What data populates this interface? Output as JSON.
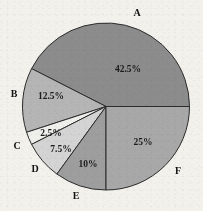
{
  "chart_data": {
    "type": "pie",
    "title": "",
    "subtitle": "",
    "xlabel": "",
    "ylabel": "",
    "legend_position": "none",
    "grid": false,
    "start_angle_deg": 0,
    "direction": "counterclockwise",
    "categories": [
      "A",
      "B",
      "C",
      "D",
      "E",
      "F"
    ],
    "values": [
      42.5,
      12.5,
      2.5,
      7.5,
      10,
      25
    ],
    "value_labels": [
      "42.5%",
      "12.5%",
      "2.5%",
      "7.5%",
      "10%",
      "25%"
    ],
    "colors": [
      "#8c8c8c",
      "#b5b5b5",
      "#efefec",
      "#d4d4d4",
      "#9e9e9e",
      "#a8a8a8"
    ],
    "slices": [
      {
        "name": "A",
        "value": 42.5,
        "value_label": "42.5%",
        "color": "#8c8c8c",
        "start_deg": 0,
        "end_deg": 153,
        "label_x": 128,
        "label_y": 70,
        "cat_x": 137,
        "cat_y": 14
      },
      {
        "name": "B",
        "value": 12.5,
        "value_label": "12.5%",
        "color": "#b5b5b5",
        "start_deg": 153,
        "end_deg": 198,
        "label_x": 51,
        "label_y": 97,
        "cat_x": 14,
        "cat_y": 95
      },
      {
        "name": "C",
        "value": 2.5,
        "value_label": "2.5%",
        "color": "#efefec",
        "start_deg": 198,
        "end_deg": 207,
        "label_x": 51,
        "label_y": 134,
        "cat_x": 17,
        "cat_y": 147
      },
      {
        "name": "D",
        "value": 7.5,
        "value_label": "7.5%",
        "color": "#d4d4d4",
        "start_deg": 207,
        "end_deg": 234,
        "label_x": 61,
        "label_y": 150,
        "cat_x": 35,
        "cat_y": 170
      },
      {
        "name": "E",
        "value": 10,
        "value_label": "10%",
        "color": "#9e9e9e",
        "start_deg": 234,
        "end_deg": 270,
        "label_x": 88,
        "label_y": 165,
        "cat_x": 76,
        "cat_y": 197
      },
      {
        "name": "F",
        "value": 25,
        "value_label": "25%",
        "color": "#a8a8a8",
        "start_deg": 270,
        "end_deg": 360,
        "label_x": 143,
        "label_y": 143,
        "cat_x": 178,
        "cat_y": 172
      }
    ],
    "geometry": {
      "cx": 106,
      "cy": 106.5,
      "r": 83.5
    }
  }
}
